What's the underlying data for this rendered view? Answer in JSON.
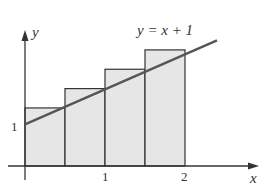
{
  "diagram": {
    "function_label": "y = x + 1",
    "axis_labels": {
      "x": "x",
      "y": "y"
    },
    "x_ticks": [
      {
        "value": 1,
        "label": "1"
      },
      {
        "value": 2,
        "label": "2"
      }
    ],
    "y_ticks": [
      {
        "value": 1,
        "label": "1"
      }
    ],
    "rectangles": [
      {
        "x0": 0.0,
        "x1": 0.5,
        "height": 1.5
      },
      {
        "x0": 0.5,
        "x1": 1.0,
        "height": 2.0
      },
      {
        "x0": 1.0,
        "x1": 1.5,
        "height": 2.5
      },
      {
        "x0": 1.5,
        "x1": 2.0,
        "height": 3.0
      }
    ],
    "line": {
      "slope": 1,
      "intercept": 1,
      "x_start": 0,
      "x_end": 2.4
    },
    "colors": {
      "fill": "#e6e6e6",
      "stroke": "#333333",
      "line": "#555555"
    }
  }
}
